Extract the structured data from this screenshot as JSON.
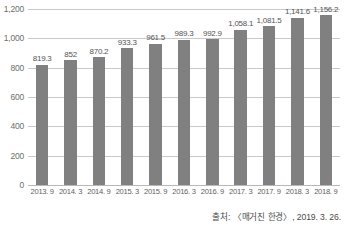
{
  "chart_data": {
    "type": "bar",
    "title": "",
    "subtitle": "",
    "xlabel": "",
    "ylabel": "",
    "ylim": [
      0,
      1200
    ],
    "y_ticks": [
      "0",
      "200",
      "400",
      "600",
      "800",
      "1,000",
      "1,200"
    ],
    "y_tick_values": [
      0,
      200,
      400,
      600,
      800,
      1000,
      1200
    ],
    "grid": true,
    "legend": false,
    "legend_position": "none",
    "categories": [
      "2013. 9",
      "2014. 3",
      "2014. 9",
      "2015. 3",
      "2015. 9",
      "2016. 3",
      "2016. 9",
      "2017. 3",
      "2017. 9",
      "2018. 3",
      "2018. 9"
    ],
    "values": [
      819.3,
      852,
      870.2,
      933.3,
      961.5,
      989.3,
      992.9,
      1058.1,
      1081.5,
      1141.6,
      1156.2
    ],
    "data_labels": [
      "819.3",
      "852",
      "870.2",
      "933.3",
      "961.5",
      "989.3",
      "992.9",
      "1,058.1",
      "1,081.5",
      "1,141.6",
      "1,156.2"
    ],
    "bar_color": "#808080",
    "gridline_color": "#c9c9c9",
    "background_color": "#ffffff"
  },
  "caption": {
    "source_text": "출처: 〈매거진 한경〉, 2019. 3. 26."
  }
}
